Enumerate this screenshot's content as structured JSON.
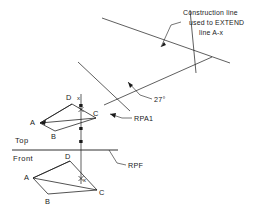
{
  "drawing": {
    "title": "Descriptive geometry construction - Top and Front views",
    "stroke_color": "#1a1a1a",
    "background_color": "#ffffff",
    "annotations": {
      "construction_note_line1": "Construction line",
      "construction_note_line2": "used to EXTEND",
      "construction_note_line3": "line A-x",
      "angle_label": "27°",
      "rpa1_label": "RPA1",
      "rpf_label": "RPF"
    },
    "views": {
      "top": {
        "name": "Top",
        "vertices": [
          {
            "label": "A"
          },
          {
            "label": "B"
          },
          {
            "label": "C"
          },
          {
            "label": "D"
          }
        ],
        "point_marker": "x"
      },
      "front": {
        "name": "Front",
        "vertices": [
          {
            "label": "A"
          },
          {
            "label": "B"
          },
          {
            "label": "C"
          },
          {
            "label": "D"
          }
        ],
        "point_marker": "x"
      }
    }
  }
}
